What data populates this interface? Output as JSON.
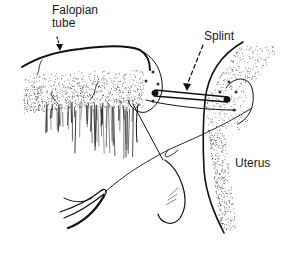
{
  "figure": {
    "type": "surgical-illustration",
    "ink_color": "#111111",
    "background": "#ffffff"
  },
  "labels": {
    "falopian_tube": "Falopian\ntube",
    "splint": "Splint",
    "uterus": "Uterus"
  },
  "annotations": [
    {
      "label": "Falopian tube",
      "pointer": "solid-arrow",
      "target": "tube-outline"
    },
    {
      "label": "Splint",
      "pointer": "dashed-arrow",
      "target": "splint-rod"
    },
    {
      "label": "Uterus",
      "pointer": "none",
      "target": "uterus-body"
    }
  ]
}
